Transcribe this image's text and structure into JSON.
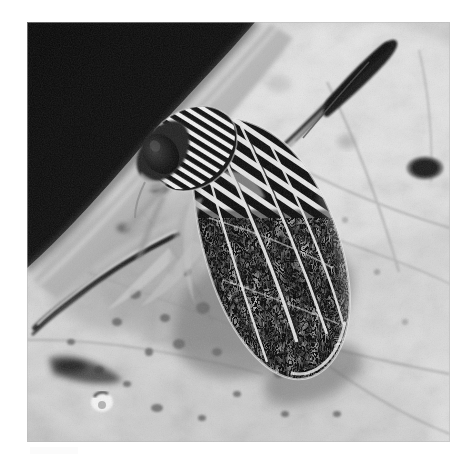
{
  "document": {
    "kind": "photograph",
    "palette_mode": "grayscale",
    "background_color": "#ffffff"
  },
  "photo": {
    "title": "Leafhopper on a leaf",
    "description": "Black and white close-up photograph of a striped leafhopper insect resting on a mottled leaf surface, with a dark shadowed background in the upper left corner.",
    "frame": {
      "left": 27,
      "top": 22,
      "width": 423,
      "height": 420
    },
    "tones": {
      "darkest": "#0a0a0a",
      "shadow": "#1b1b1b",
      "midtone": "#808080",
      "leaf_light": "#d8d8d8",
      "highlight": "#f2f2f2",
      "paper_white": "#ffffff"
    },
    "regions": [
      {
        "name": "dark-background",
        "label": "Shadowed background",
        "position": "upper-left",
        "tone": "#101010"
      },
      {
        "name": "leaf-surface",
        "label": "Mottled leaf surface",
        "position": "center-right and lower",
        "tone": "#cfcfcf"
      },
      {
        "name": "leaf-edge",
        "label": "Leaf edge running diagonally",
        "position": "upper-left to center",
        "tone": "#a8a8a8"
      }
    ],
    "subject": {
      "name": "leafhopper",
      "common_name": "Leafhopper",
      "orientation": "head upper-left, abdomen tip lower-right",
      "parts": [
        {
          "name": "head",
          "label": "Head",
          "tone": "#202020"
        },
        {
          "name": "eye",
          "label": "Compound eye",
          "tone": "#0d0d0d"
        },
        {
          "name": "pronotum",
          "label": "Striped pronotum",
          "pattern": "diagonal black and white stripes"
        },
        {
          "name": "forewing",
          "label": "Forewing (tegmen)",
          "pattern": "reticulated white maze on black"
        },
        {
          "name": "wing-veins",
          "label": "Wing veins",
          "tone": "#e8e8e8"
        },
        {
          "name": "hind-leg-upper",
          "label": "Raised hind leg",
          "position": "upper-right",
          "tone": "#262626"
        },
        {
          "name": "hind-leg-lower",
          "label": "Extended leg",
          "position": "lower-left",
          "tone": "#303030"
        }
      ]
    },
    "leaf_spots": [
      {
        "name": "dark-oval-spot",
        "cx": 398,
        "cy": 146,
        "rx": 14,
        "ry": 9
      },
      {
        "name": "pale-ring-spot",
        "cx": 75,
        "cy": 380,
        "rx": 9,
        "ry": 8
      }
    ]
  },
  "caption": {
    "visible_text": "",
    "note": "faint scan smudge below the photograph, no legible text"
  }
}
